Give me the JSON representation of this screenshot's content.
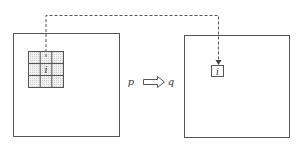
{
  "diagram": {
    "left_grid_label": "i",
    "right_box_label": "i",
    "mapping": {
      "from": "p",
      "to": "q",
      "arrow": "double-right-arrow"
    },
    "colors": {
      "stroke": "#555555",
      "grid_fill": "#e6e6e6",
      "text": "#333333"
    }
  }
}
